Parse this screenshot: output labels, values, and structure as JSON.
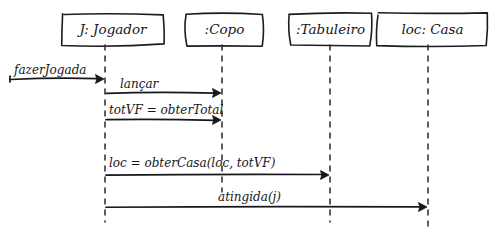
{
  "diagram": {
    "kind": "uml-sequence-diagram",
    "style": "hand-drawn",
    "background_color": "#ffffff",
    "ink_color": "#17171b",
    "width": 497,
    "height": 232,
    "lifelines": [
      {
        "id": "jogador",
        "label": "J: Jogador",
        "x": 105,
        "box_x": 63,
        "box_y": 14,
        "box_w": 100,
        "box_h": 31,
        "lifeline_bottom": 222
      },
      {
        "id": "copo",
        "label": ":Copo",
        "x": 222,
        "box_x": 186,
        "box_y": 14,
        "box_w": 77,
        "box_h": 31,
        "lifeline_bottom": 192
      },
      {
        "id": "tabuleiro",
        "label": ":Tabuleiro",
        "x": 330,
        "box_x": 290,
        "box_y": 14,
        "box_w": 81,
        "box_h": 31,
        "lifeline_bottom": 222
      },
      {
        "id": "casa",
        "label": "loc: Casa",
        "x": 428,
        "box_x": 378,
        "box_y": 14,
        "box_w": 109,
        "box_h": 31,
        "lifeline_bottom": 228
      }
    ],
    "messages": [
      {
        "id": "msg-fazer-jogada",
        "label": "fazerJogada",
        "kind": "found-message",
        "from_x": 10,
        "to_x": 104,
        "y": 79,
        "label_x": 14,
        "label_y": 74,
        "arrowhead": "filled"
      },
      {
        "id": "msg-lancar",
        "label": "lançar",
        "kind": "synchronous",
        "from": "jogador",
        "to": "copo",
        "from_x": 106,
        "to_x": 221,
        "y": 93,
        "label_x": 120,
        "label_y": 88,
        "arrowhead": "filled"
      },
      {
        "id": "msg-obter-total",
        "label": "totVF = obterTotal",
        "kind": "synchronous",
        "from": "jogador",
        "to": "copo",
        "from_x": 106,
        "to_x": 221,
        "y": 120,
        "label_x": 109,
        "label_y": 114,
        "arrowhead": "filled"
      },
      {
        "id": "msg-obter-casa",
        "label": "loc = obterCasa(loc, totVF)",
        "kind": "synchronous",
        "from": "jogador",
        "to": "tabuleiro",
        "from_x": 106,
        "to_x": 329,
        "y": 175,
        "label_x": 109,
        "label_y": 167,
        "arrowhead": "filled"
      },
      {
        "id": "msg-atingida",
        "label": "atingida(j)",
        "kind": "synchronous",
        "from": "jogador",
        "to": "casa",
        "from_x": 106,
        "to_x": 427,
        "y": 207,
        "label_x": 218,
        "label_y": 201,
        "arrowhead": "filled"
      }
    ]
  }
}
